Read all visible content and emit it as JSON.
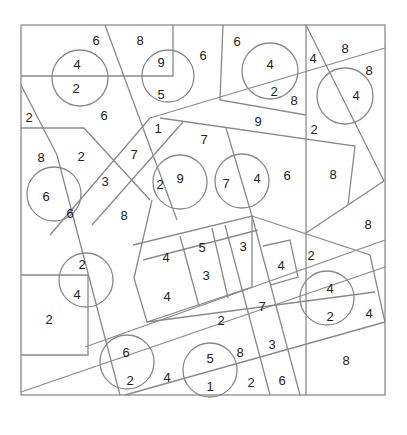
{
  "colors": {
    "line": "#8a8a8a",
    "text": "#222222",
    "background": "#ffffff"
  },
  "frame": {
    "x": 21,
    "y": 25,
    "w": 364,
    "h": 370
  },
  "circles": [
    {
      "cx": 80,
      "cy": 78,
      "r": 28
    },
    {
      "cx": 168,
      "cy": 76,
      "r": 26
    },
    {
      "cx": 270,
      "cy": 71,
      "r": 28
    },
    {
      "cx": 345,
      "cy": 96,
      "r": 28
    },
    {
      "cx": 180,
      "cy": 182,
      "r": 27
    },
    {
      "cx": 242,
      "cy": 181,
      "r": 27
    },
    {
      "cx": 54,
      "cy": 194,
      "r": 27
    },
    {
      "cx": 86,
      "cy": 280,
      "r": 27
    },
    {
      "cx": 327,
      "cy": 298,
      "r": 27
    },
    {
      "cx": 127,
      "cy": 362,
      "r": 27
    },
    {
      "cx": 210,
      "cy": 370,
      "r": 27
    }
  ],
  "numbers": [
    {
      "x": 96,
      "y": 40,
      "v": "6"
    },
    {
      "x": 140,
      "y": 40,
      "v": "8"
    },
    {
      "x": 203,
      "y": 55,
      "v": "6"
    },
    {
      "x": 77,
      "y": 64,
      "v": "4"
    },
    {
      "x": 76,
      "y": 88,
      "v": "2"
    },
    {
      "x": 161,
      "y": 62,
      "v": "9"
    },
    {
      "x": 161,
      "y": 94,
      "v": "5"
    },
    {
      "x": 237,
      "y": 41,
      "v": "6"
    },
    {
      "x": 270,
      "y": 64,
      "v": "4"
    },
    {
      "x": 274,
      "y": 91,
      "v": "2"
    },
    {
      "x": 294,
      "y": 100,
      "v": "8"
    },
    {
      "x": 313,
      "y": 58,
      "v": "4"
    },
    {
      "x": 345,
      "y": 48,
      "v": "8"
    },
    {
      "x": 369,
      "y": 70,
      "v": "8"
    },
    {
      "x": 356,
      "y": 95,
      "v": "4"
    },
    {
      "x": 29,
      "y": 117,
      "v": "2"
    },
    {
      "x": 104,
      "y": 115,
      "v": "6"
    },
    {
      "x": 158,
      "y": 128,
      "v": "1"
    },
    {
      "x": 258,
      "y": 121,
      "v": "9"
    },
    {
      "x": 314,
      "y": 129,
      "v": "2"
    },
    {
      "x": 204,
      "y": 139,
      "v": "7"
    },
    {
      "x": 41,
      "y": 157,
      "v": "8"
    },
    {
      "x": 81,
      "y": 156,
      "v": "2"
    },
    {
      "x": 134,
      "y": 154,
      "v": "7"
    },
    {
      "x": 105,
      "y": 181,
      "v": "3"
    },
    {
      "x": 160,
      "y": 184,
      "v": "2"
    },
    {
      "x": 180,
      "y": 178,
      "v": "9"
    },
    {
      "x": 226,
      "y": 183,
      "v": "7"
    },
    {
      "x": 257,
      "y": 178,
      "v": "4"
    },
    {
      "x": 287,
      "y": 175,
      "v": "6"
    },
    {
      "x": 333,
      "y": 174,
      "v": "8"
    },
    {
      "x": 46,
      "y": 196,
      "v": "6"
    },
    {
      "x": 70,
      "y": 213,
      "v": "6"
    },
    {
      "x": 124,
      "y": 215,
      "v": "8"
    },
    {
      "x": 368,
      "y": 224,
      "v": "8"
    },
    {
      "x": 166,
      "y": 257,
      "v": "4"
    },
    {
      "x": 202,
      "y": 247,
      "v": "5"
    },
    {
      "x": 243,
      "y": 246,
      "v": "3"
    },
    {
      "x": 281,
      "y": 265,
      "v": "4"
    },
    {
      "x": 311,
      "y": 255,
      "v": "2"
    },
    {
      "x": 206,
      "y": 275,
      "v": "3"
    },
    {
      "x": 167,
      "y": 296,
      "v": "4"
    },
    {
      "x": 82,
      "y": 264,
      "v": "2"
    },
    {
      "x": 77,
      "y": 294,
      "v": "4"
    },
    {
      "x": 49,
      "y": 319,
      "v": "2"
    },
    {
      "x": 262,
      "y": 306,
      "v": "7"
    },
    {
      "x": 221,
      "y": 320,
      "v": "2"
    },
    {
      "x": 330,
      "y": 288,
      "v": "4"
    },
    {
      "x": 330,
      "y": 316,
      "v": "2"
    },
    {
      "x": 369,
      "y": 313,
      "v": "4"
    },
    {
      "x": 126,
      "y": 352,
      "v": "6"
    },
    {
      "x": 130,
      "y": 380,
      "v": "2"
    },
    {
      "x": 167,
      "y": 377,
      "v": "4"
    },
    {
      "x": 210,
      "y": 358,
      "v": "5"
    },
    {
      "x": 210,
      "y": 386,
      "v": "1"
    },
    {
      "x": 240,
      "y": 352,
      "v": "8"
    },
    {
      "x": 272,
      "y": 344,
      "v": "3"
    },
    {
      "x": 251,
      "y": 382,
      "v": "2"
    },
    {
      "x": 282,
      "y": 380,
      "v": "6"
    },
    {
      "x": 346,
      "y": 360,
      "v": "8"
    }
  ]
}
